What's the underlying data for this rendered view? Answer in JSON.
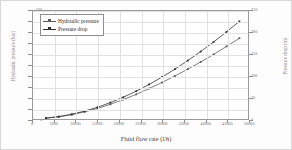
{
  "chart_data": {
    "type": "line",
    "title": "",
    "xlabel": "Fluid flow rate (l/h)",
    "ylabel": "Hydraulic pressure (bar)",
    "ylabel_right": "Pressure drop (m)",
    "xlim": [
      0,
      50000
    ],
    "ylim": [
      0,
      500
    ],
    "ylim_right": [
      0,
      250
    ],
    "grid": true,
    "legend_position": "top-left",
    "xticks": [
      "0",
      "5000",
      "10000",
      "15000",
      "20000",
      "25000",
      "30000",
      "35000",
      "40000",
      "45000",
      "50000"
    ],
    "yticks_left": [
      "0",
      "50",
      "100",
      "150",
      "200",
      "250",
      "300",
      "350",
      "400",
      "450",
      "500"
    ],
    "yticks_right": [
      "0",
      "50",
      "100",
      "150",
      "200",
      "250"
    ],
    "x": [
      3000,
      6000,
      9000,
      12000,
      15000,
      18000,
      21000,
      24000,
      27000,
      30000,
      33000,
      36000,
      39000,
      42000,
      45000,
      48000
    ],
    "series": [
      {
        "name": "Hydraulic pressure",
        "unit": "bar",
        "axis": "left",
        "color": "#5a5a5a",
        "values": [
          4,
          10,
          20,
          33,
          49,
          68,
          90,
          114,
          141,
          169,
          199,
          231,
          264,
          299,
          336,
          374
        ]
      },
      {
        "name": "Pressure drop",
        "unit": "m",
        "axis": "right",
        "color": "#303030",
        "values": [
          2.2,
          5.6,
          11.0,
          18.2,
          27.2,
          38.0,
          50.4,
          64.4,
          80.0,
          97.0,
          115.4,
          135.2,
          156.2,
          178.4,
          201.8,
          226.0
        ]
      }
    ]
  },
  "legend": {
    "items": [
      {
        "label": "Hydraulic pressure"
      },
      {
        "label": "Pressure drop"
      }
    ]
  }
}
